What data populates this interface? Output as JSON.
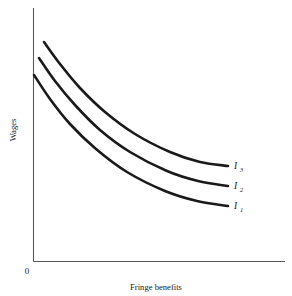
{
  "figure": {
    "background_color": "#ffffff",
    "axis_color": "#5a5a5a",
    "curve_color": "#1a1a1a",
    "origin_label": "0",
    "xlabel": "Fringe benefits",
    "ylabel": "Wages"
  },
  "chart_data": {
    "type": "line",
    "title": "",
    "subtitle": "",
    "xlabel": "Fringe benefits",
    "ylabel": "Wages",
    "origin_label": "0",
    "grid": false,
    "legend_position": "inline-right-of-curve-end",
    "axis_ranges": {
      "x": [
        0,
        1
      ],
      "y": [
        0,
        1
      ]
    },
    "axis_tick_labels": {
      "x": [],
      "y": []
    },
    "annotations": [
      "Convex indifference curves for wages versus fringe benefits",
      "Higher curves represent higher utility levels"
    ],
    "series": [
      {
        "name": "I3",
        "label_base": "I",
        "label_sub": "3",
        "utility_rank": 3,
        "description": "highest indifference curve",
        "points": [
          {
            "x": 44,
            "y": 42
          },
          {
            "x": 60,
            "y": 64
          },
          {
            "x": 80,
            "y": 88
          },
          {
            "x": 105,
            "y": 112
          },
          {
            "x": 135,
            "y": 134
          },
          {
            "x": 170,
            "y": 152
          },
          {
            "x": 200,
            "y": 162
          },
          {
            "x": 228,
            "y": 166
          }
        ],
        "label_position": {
          "x": 234,
          "y": 169
        }
      },
      {
        "name": "I2",
        "label_base": "I",
        "label_sub": "2",
        "utility_rank": 2,
        "description": "middle indifference curve",
        "points": [
          {
            "x": 39,
            "y": 58
          },
          {
            "x": 55,
            "y": 81
          },
          {
            "x": 75,
            "y": 105
          },
          {
            "x": 100,
            "y": 130
          },
          {
            "x": 130,
            "y": 152
          },
          {
            "x": 167,
            "y": 171
          },
          {
            "x": 198,
            "y": 181
          },
          {
            "x": 228,
            "y": 186
          }
        ],
        "label_position": {
          "x": 234,
          "y": 189
        }
      },
      {
        "name": "I1",
        "label_base": "I",
        "label_sub": "1",
        "utility_rank": 1,
        "description": "lowest indifference curve",
        "points": [
          {
            "x": 34,
            "y": 75
          },
          {
            "x": 50,
            "y": 99
          },
          {
            "x": 70,
            "y": 124
          },
          {
            "x": 96,
            "y": 149
          },
          {
            "x": 127,
            "y": 172
          },
          {
            "x": 165,
            "y": 191
          },
          {
            "x": 197,
            "y": 201
          },
          {
            "x": 228,
            "y": 206
          }
        ],
        "label_position": {
          "x": 234,
          "y": 209
        }
      }
    ]
  }
}
